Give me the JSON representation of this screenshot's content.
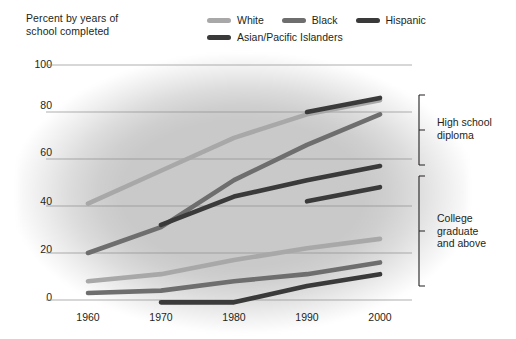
{
  "axis_title": "Percent by years of\nschool completed",
  "axis_title_line1": "Percent by years of",
  "axis_title_line2": "school completed",
  "legend": {
    "items": [
      {
        "label": "White",
        "color": "#a8a8a8"
      },
      {
        "label": "Black",
        "color": "#6e6e6e"
      },
      {
        "label": "Hispanic",
        "color": "#3a3a3a"
      },
      {
        "label": "Asian/Pacific Islanders",
        "color": "#3a3a3a"
      }
    ]
  },
  "brackets": [
    {
      "id": "high-school",
      "label_line1": "High school",
      "label_line2": "diploma"
    },
    {
      "id": "college",
      "label_line1": "College",
      "label_line2": "graduate",
      "label_line3": "and above"
    }
  ],
  "chart_data": {
    "type": "line",
    "title": "Percent by years of school completed",
    "xlabel": "",
    "ylabel": "Percent by years of school completed",
    "x": [
      1960,
      1970,
      1980,
      1990,
      2000
    ],
    "xticklabels": [
      "1960",
      "1970",
      "1980",
      "1990",
      "2000"
    ],
    "yticks": [
      0,
      20,
      40,
      60,
      80,
      100
    ],
    "yticklabels": [
      "0",
      "20",
      "40",
      "60",
      "80",
      "100"
    ],
    "ylim": [
      0,
      100
    ],
    "grid": true,
    "legend_position": "top",
    "groups": [
      {
        "name": "High school diploma",
        "series": [
          {
            "name": "White",
            "color": "#a8a8a8",
            "x": [
              1960,
              1970,
              1980,
              1990,
              2000
            ],
            "values": [
              41,
              55,
              69,
              79,
              85
            ]
          },
          {
            "name": "Black",
            "color": "#6e6e6e",
            "x": [
              1960,
              1970,
              1980,
              1990,
              2000
            ],
            "values": [
              20,
              31,
              51,
              66,
              79
            ]
          },
          {
            "name": "Hispanic",
            "color": "#3a3a3a",
            "x": [
              1970,
              1980,
              1990,
              2000
            ],
            "values": [
              32,
              44,
              51,
              57
            ]
          },
          {
            "name": "Asian/Pacific Islanders",
            "color": "#3a3a3a",
            "x": [
              1990,
              2000
            ],
            "values": [
              80,
              86
            ]
          }
        ]
      },
      {
        "name": "College graduate and above",
        "series": [
          {
            "name": "White",
            "color": "#a8a8a8",
            "x": [
              1960,
              1970,
              1980,
              1990,
              2000
            ],
            "values": [
              8,
              11,
              17,
              22,
              26
            ]
          },
          {
            "name": "Black",
            "color": "#6e6e6e",
            "x": [
              1960,
              1970,
              1980,
              1990,
              2000
            ],
            "values": [
              3,
              4,
              8,
              11,
              16
            ]
          },
          {
            "name": "Hispanic",
            "color": "#3a3a3a",
            "x": [
              1970,
              1980,
              1990,
              2000
            ],
            "values": [
              -1,
              -1,
              6,
              11
            ]
          },
          {
            "name": "Asian/Pacific Islanders",
            "color": "#3a3a3a",
            "x": [
              1990,
              2000
            ],
            "values": [
              42,
              48
            ]
          }
        ]
      }
    ]
  }
}
